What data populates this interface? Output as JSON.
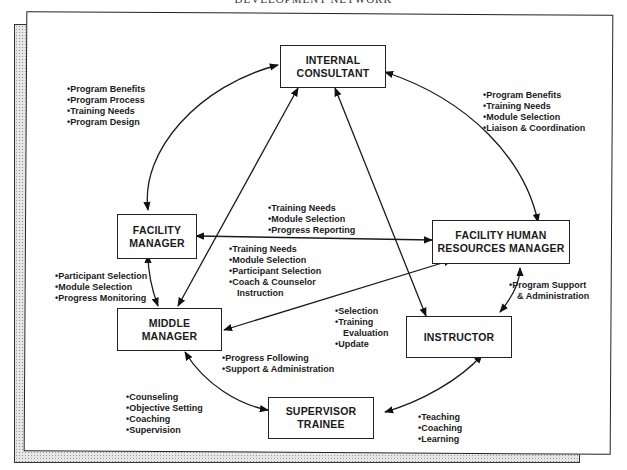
{
  "title": "DEVELOPMENT NETWORK",
  "nodes": {
    "internal_consultant": {
      "line1": "INTERNAL",
      "line2": "CONSULTANT"
    },
    "facility_manager": {
      "line1": "FACILITY",
      "line2": "MANAGER"
    },
    "facility_hr_manager": {
      "line1": "FACILITY HUMAN",
      "line2": "RESOURCES MANAGER"
    },
    "middle_manager": {
      "line1": "MIDDLE",
      "line2": "MANAGER"
    },
    "instructor": {
      "line1": "INSTRUCTOR"
    },
    "supervisor_trainee": {
      "line1": "SUPERVISOR",
      "line2": "TRAINEE"
    }
  },
  "edge_labels": {
    "consultant_facility_manager": [
      "Program Benefits",
      "Program Process",
      "Training Needs",
      "Program Design"
    ],
    "consultant_hr_manager": [
      "Program Benefits",
      "Training Needs",
      "Module Selection",
      "Liaison & Coordination"
    ],
    "facility_manager_hr_manager": [
      "Training Needs",
      "Module Selection",
      "Progress Reporting"
    ],
    "hr_manager_middle_manager": [
      "Training Needs",
      "Module Selection",
      "Participant Selection",
      "Coach & Counselor",
      "Instruction"
    ],
    "facility_manager_middle_manager": [
      "Participant Selection",
      "Module Selection",
      "Progress Monitoring"
    ],
    "hr_manager_instructor": [
      "Program Support",
      "& Administration"
    ],
    "consultant_instructor": [
      "Selection",
      "Training",
      "Evaluation",
      "Update"
    ],
    "middle_manager_supervisor": [
      "Progress Following",
      "Support & Administration"
    ],
    "supervisor_self": [
      "Counseling",
      "Objective Setting",
      "Coaching",
      "Supervision"
    ],
    "instructor_supervisor": [
      "Teaching",
      "Coaching",
      "Learning"
    ]
  },
  "colors": {
    "ink": "#1a1a1a",
    "shadow_fill": "#e6e6e6",
    "paper": "#ffffff"
  }
}
